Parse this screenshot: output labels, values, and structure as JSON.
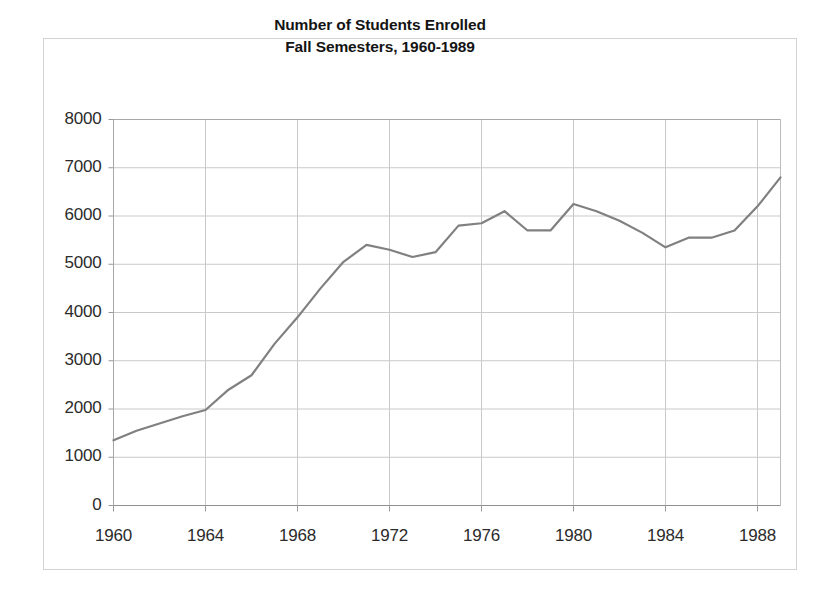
{
  "figure": {
    "background_color": "#ffffff",
    "frame_color": "#d4d4d4"
  },
  "chart_data": {
    "type": "line",
    "title": "Number of Students Enrolled\nFall Semesters, 1960-1989",
    "title_lines": [
      "Number of Students Enrolled",
      "Fall Semesters, 1960-1989"
    ],
    "xlabel": "",
    "ylabel": "",
    "xlim": [
      1960,
      1989
    ],
    "ylim": [
      0,
      8000
    ],
    "grid": true,
    "grid_color": "#c9c9c9",
    "legend": false,
    "legend_position": "none",
    "line_color": "#808080",
    "line_width": 2.2,
    "markers": false,
    "ytick_labels": [
      "8000",
      "7000",
      "6000",
      "5000",
      "4000",
      "3000",
      "2000",
      "1000",
      "0"
    ],
    "yticks": [
      8000,
      7000,
      6000,
      5000,
      4000,
      3000,
      2000,
      1000,
      0
    ],
    "xtick_labels": [
      "1960",
      "1964",
      "1968",
      "1972",
      "1976",
      "1980",
      "1984",
      "1988"
    ],
    "xticks": [
      1960,
      1964,
      1968,
      1972,
      1976,
      1980,
      1984,
      1988
    ],
    "x": [
      1960,
      1961,
      1962,
      1963,
      1964,
      1965,
      1966,
      1967,
      1968,
      1969,
      1970,
      1971,
      1972,
      1973,
      1974,
      1975,
      1976,
      1977,
      1978,
      1979,
      1980,
      1981,
      1982,
      1983,
      1984,
      1985,
      1986,
      1987,
      1988,
      1989
    ],
    "series": [
      {
        "name": "Students Enrolled",
        "values": [
          1350,
          1550,
          1700,
          1850,
          1980,
          2400,
          2700,
          3350,
          3900,
          4500,
          5050,
          5400,
          5300,
          5150,
          5250,
          5800,
          5850,
          6100,
          5700,
          5700,
          6250,
          6100,
          5900,
          5650,
          5350,
          5550,
          5550,
          5700,
          6200,
          6800
        ]
      }
    ]
  }
}
